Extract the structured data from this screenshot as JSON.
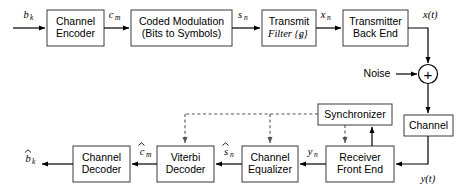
{
  "figure": {
    "type": "block-diagram",
    "width": 467,
    "height": 195,
    "background_color": "#ffffff",
    "line_color": "#000000",
    "box_stroke_color": "#3a3a3a",
    "dashed_line_color": "#555555"
  },
  "blocks": {
    "channel_encoder": {
      "line1": "Channel",
      "line2": "Encoder"
    },
    "coded_modulation": {
      "line1": "Coded Modulation",
      "line2": "(Bits to Symbols)"
    },
    "transmit_filter": {
      "line1": "Transmit",
      "line2": "Filter {g"
    },
    "transmit_filter_sub": {
      "sub": "i",
      "close": "}"
    },
    "transmitter_back_end": {
      "line1": "Transmitter",
      "line2": "Back End"
    },
    "channel": {
      "line1": "Channel"
    },
    "synchronizer": {
      "line1": "Synchronizer"
    },
    "receiver_front_end": {
      "line1": "Receiver",
      "line2": "Front End"
    },
    "channel_equalizer": {
      "line1": "Channel",
      "line2": "Equalizer"
    },
    "viterbi_decoder": {
      "line1": "Viterbi",
      "line2": "Decoder"
    },
    "channel_decoder": {
      "line1": "Channel",
      "line2": "Decoder"
    },
    "summer": {
      "symbol": "+"
    }
  },
  "labels": {
    "noise": "Noise",
    "b_k": {
      "base": "b",
      "sub": "k",
      "hat": false
    },
    "c_m": {
      "base": "c",
      "sub": "m",
      "hat": false
    },
    "s_n": {
      "base": "s",
      "sub": "n",
      "hat": false
    },
    "x_n": {
      "base": "x",
      "sub": "n",
      "hat": false
    },
    "x_t": {
      "base": "x(t)",
      "sub": "",
      "hat": false
    },
    "y_t": {
      "base": "y(t)",
      "sub": "",
      "hat": false
    },
    "y_n": {
      "base": "y",
      "sub": "n",
      "hat": false
    },
    "s_n_hat": {
      "base": "s",
      "sub": "n",
      "hat": true
    },
    "c_m_hat": {
      "base": "c",
      "sub": "m",
      "hat": true
    },
    "b_k_hat": {
      "base": "b",
      "sub": "k",
      "hat": true
    }
  },
  "signal_flow": [
    {
      "from": "input",
      "to": "channel_encoder",
      "label": "b_k"
    },
    {
      "from": "channel_encoder",
      "to": "coded_modulation",
      "label": "c_m"
    },
    {
      "from": "coded_modulation",
      "to": "transmit_filter",
      "label": "s_n"
    },
    {
      "from": "transmit_filter",
      "to": "transmitter_back_end",
      "label": "x_n"
    },
    {
      "from": "transmitter_back_end",
      "to": "summer",
      "label": "x(t)"
    },
    {
      "from": "noise",
      "to": "summer",
      "label": "Noise"
    },
    {
      "from": "summer",
      "to": "channel",
      "label": ""
    },
    {
      "from": "channel",
      "to": "receiver_front_end",
      "label": "y(t)"
    },
    {
      "from": "receiver_front_end",
      "to": "channel_equalizer",
      "label": "y_n"
    },
    {
      "from": "channel_equalizer",
      "to": "viterbi_decoder",
      "label": "s_n_hat"
    },
    {
      "from": "viterbi_decoder",
      "to": "channel_decoder",
      "label": "c_m_hat"
    },
    {
      "from": "channel_decoder",
      "to": "output",
      "label": "b_k_hat"
    },
    {
      "from": "receiver_front_end",
      "to": "synchronizer",
      "label": "",
      "style": "solid"
    },
    {
      "from": "synchronizer",
      "to": "receiver_front_end",
      "label": "",
      "style": "dashed"
    },
    {
      "from": "synchronizer",
      "to": "channel_equalizer",
      "label": "",
      "style": "dashed"
    },
    {
      "from": "synchronizer",
      "to": "viterbi_decoder",
      "label": "",
      "style": "dashed"
    }
  ]
}
